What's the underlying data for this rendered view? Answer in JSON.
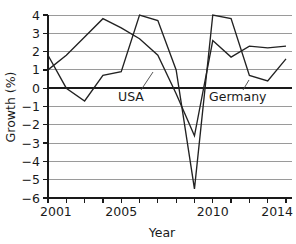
{
  "chart_data": {
    "type": "line",
    "title": "",
    "xlabel": "Year",
    "ylabel": "Growth (%)",
    "xlim": [
      2001,
      2014
    ],
    "ylim": [
      -6,
      4
    ],
    "grid": true,
    "legend_position": "inline-annotations",
    "x": [
      2001,
      2002,
      2003,
      2004,
      2005,
      2006,
      2007,
      2008,
      2009,
      2010,
      2011,
      2012,
      2013,
      2014
    ],
    "xticks": [
      2001,
      2002,
      2003,
      2004,
      2005,
      2006,
      2007,
      2008,
      2009,
      2010,
      2011,
      2012,
      2013,
      2014
    ],
    "xticklabels": [
      "2001",
      "",
      "",
      "",
      "2005",
      "",
      "",
      "",
      "",
      "2010",
      "",
      "",
      "",
      "2014"
    ],
    "xticklabels_shown": [
      "2001",
      "2005",
      "2010",
      "2014"
    ],
    "yticks": [
      -6,
      -5,
      -4,
      -3,
      -2,
      -1,
      0,
      1,
      2,
      3,
      4
    ],
    "yticklabels": [
      "−6",
      "−5",
      "−4",
      "−3",
      "−2",
      "−1",
      "0",
      "1",
      "2",
      "3",
      "4"
    ],
    "series": [
      {
        "name": "USA",
        "label": "USA",
        "color": "#222222",
        "values": [
          1.0,
          1.8,
          2.8,
          3.8,
          3.3,
          2.7,
          1.8,
          -0.3,
          -2.6,
          2.6,
          1.7,
          2.3,
          2.2,
          2.3
        ]
      },
      {
        "name": "Germany",
        "label": "Germany",
        "color": "#222222",
        "values": [
          1.8,
          0.0,
          -0.7,
          0.7,
          0.9,
          4.0,
          3.7,
          1.0,
          -5.5,
          4.0,
          3.8,
          0.7,
          0.4,
          1.6
        ]
      }
    ],
    "annotations": [
      {
        "text": "USA",
        "x": 2006.6,
        "y": -0.6
      },
      {
        "text": "Germany",
        "x": 2011.4,
        "y": -0.6
      }
    ]
  }
}
